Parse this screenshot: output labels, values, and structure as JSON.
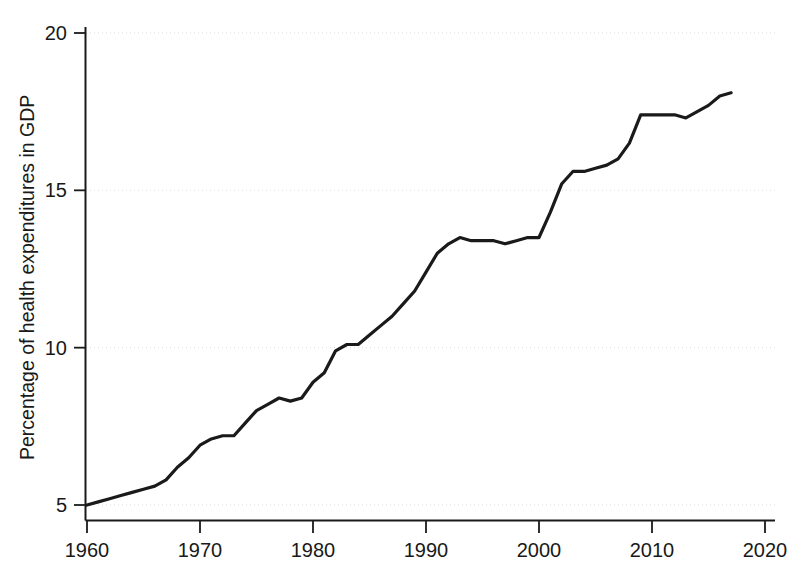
{
  "chart_data": {
    "type": "line",
    "title": "",
    "subtitle": "",
    "xlabel": "",
    "ylabel": "Percentage of health expenditures in GDP",
    "xlim": [
      1958.0,
      1960.0
    ],
    "ylim": [
      4.0,
      20.7
    ],
    "xticks": [
      1960,
      1970,
      1980,
      1990,
      2000,
      2010,
      2020
    ],
    "xtick_labels": [
      "1960",
      "1970",
      "1980",
      "1990",
      "2000",
      "2010",
      "2020"
    ],
    "yticks": [
      5,
      10,
      15,
      20
    ],
    "ytick_labels": [
      "5",
      "10",
      "15",
      "20"
    ],
    "grid": "horizontal-dotted-faint",
    "legend": "none",
    "line_color": "#1a1a1a",
    "line_width": 3.2,
    "x": [
      1960,
      1961,
      1962,
      1963,
      1964,
      1965,
      1966,
      1967,
      1968,
      1969,
      1970,
      1971,
      1972,
      1973,
      1974,
      1975,
      1976,
      1977,
      1978,
      1979,
      1980,
      1981,
      1982,
      1983,
      1984,
      1985,
      1986,
      1987,
      1988,
      1989,
      1990,
      1991,
      1992,
      1993,
      1994,
      1995,
      1996,
      1997,
      1998,
      1999,
      2000,
      2001,
      2002,
      2003,
      2004,
      2005,
      2006,
      2007,
      2008,
      2009,
      2010,
      2011,
      2012,
      2013,
      2014,
      2015,
      2016,
      2017
    ],
    "y": [
      5.0,
      5.1,
      5.2,
      5.3,
      5.4,
      5.5,
      5.6,
      5.8,
      6.2,
      6.5,
      6.9,
      7.1,
      7.2,
      7.2,
      7.6,
      8.0,
      8.2,
      8.4,
      8.3,
      8.4,
      8.9,
      9.2,
      9.9,
      10.1,
      10.1,
      10.4,
      10.7,
      11.0,
      11.4,
      11.8,
      12.4,
      13.0,
      13.3,
      13.5,
      13.4,
      13.4,
      13.4,
      13.3,
      13.4,
      13.5,
      13.5,
      14.3,
      15.2,
      15.6,
      15.6,
      15.7,
      15.8,
      16.0,
      16.5,
      17.4,
      17.4,
      17.4,
      17.4,
      17.3,
      17.5,
      17.7,
      18.0,
      18.1
    ]
  },
  "axes": {
    "y_axis_title": "Percentage of health expenditures in GDP",
    "y_tick_20": "20",
    "y_tick_15": "15",
    "y_tick_10": "10",
    "y_tick_5": "5",
    "x_tick_1960": "1960",
    "x_tick_1970": "1970",
    "x_tick_1980": "1980",
    "x_tick_1990": "1990",
    "x_tick_2000": "2000",
    "x_tick_2010": "2010",
    "x_tick_2020": "2020"
  },
  "colors": {
    "line": "#1a1a1a",
    "axis": "#1a1a1a",
    "grid": "#dcdcdc",
    "background": "#ffffff",
    "text": "#191919"
  }
}
